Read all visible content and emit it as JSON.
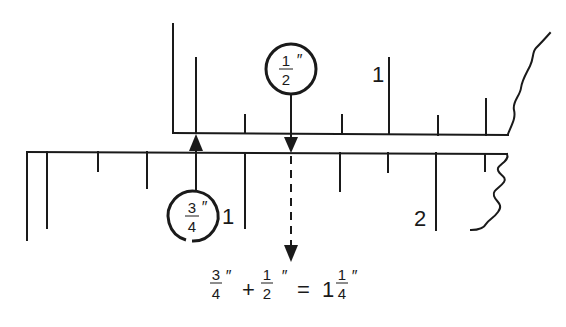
{
  "diagram": {
    "type": "ruler-addition",
    "upper_ruler": {
      "major_label": "1",
      "callout": {
        "num": "1",
        "den": "2",
        "unit": "″"
      }
    },
    "lower_ruler": {
      "major_labels": [
        "1",
        "2"
      ],
      "callout": {
        "num": "3",
        "den": "4",
        "unit": "″"
      }
    },
    "equation": {
      "a_num": "3",
      "a_den": "4",
      "a_unit": "″",
      "op": "+",
      "b_num": "1",
      "b_den": "2",
      "b_unit": "″",
      "eq": "=",
      "whole": "1",
      "c_num": "1",
      "c_den": "4",
      "c_unit": "″"
    },
    "colors": {
      "ink": "#1a1a1a",
      "background": "#ffffff"
    }
  }
}
